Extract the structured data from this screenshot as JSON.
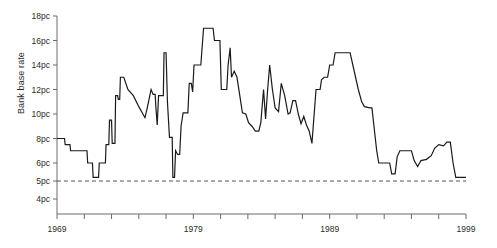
{
  "chart_data": {
    "type": "line",
    "title": "",
    "xlabel": "",
    "ylabel": "Bank base rate",
    "xlim": [
      1969,
      1999
    ],
    "ylim": [
      4,
      18
    ],
    "grid": false,
    "legend": null,
    "y_tick_labels": [
      "18pc",
      "16pc",
      "14pc",
      "12pc",
      "10pc",
      "8pc",
      "6pc",
      "5pc",
      "4pc"
    ],
    "y_tick_values": [
      18,
      16,
      14,
      12,
      10,
      8,
      6,
      5,
      4
    ],
    "x_tick_values": [
      1969,
      1971,
      1973,
      1975,
      1977,
      1979,
      1981,
      1983,
      1985,
      1987,
      1989,
      1991,
      1993,
      1995,
      1997,
      1999
    ],
    "x_tick_labels_shown": [
      "1969",
      "1979",
      "1989",
      "1999"
    ],
    "x_labelled_ticks": [
      1969,
      1979,
      1989,
      1999
    ],
    "reference_line": {
      "value": 5,
      "label": "5pc",
      "style": "dashed",
      "color": "#555555"
    },
    "line_color": "#1a1a1a",
    "axis_color": "#6b6b6b",
    "series": [
      {
        "name": "Bank base rate",
        "points": [
          [
            1969.0,
            8.0
          ],
          [
            1969.55,
            8.0
          ],
          [
            1969.6,
            7.5
          ],
          [
            1969.95,
            7.5
          ],
          [
            1970.0,
            7.0
          ],
          [
            1970.75,
            7.0
          ],
          [
            1970.8,
            7.0
          ],
          [
            1971.2,
            7.0
          ],
          [
            1971.25,
            6.0
          ],
          [
            1971.6,
            6.0
          ],
          [
            1971.65,
            5.2
          ],
          [
            1972.05,
            5.2
          ],
          [
            1972.1,
            6.0
          ],
          [
            1972.55,
            6.0
          ],
          [
            1972.6,
            7.5
          ],
          [
            1972.8,
            7.5
          ],
          [
            1972.85,
            9.5
          ],
          [
            1973.0,
            9.5
          ],
          [
            1973.05,
            7.6
          ],
          [
            1973.25,
            7.6
          ],
          [
            1973.3,
            11.5
          ],
          [
            1973.45,
            11.5
          ],
          [
            1973.5,
            11.2
          ],
          [
            1973.6,
            11.2
          ],
          [
            1973.65,
            13.0
          ],
          [
            1973.9,
            13.0
          ],
          [
            1974.2,
            12.0
          ],
          [
            1974.6,
            11.5
          ],
          [
            1975.0,
            10.6
          ],
          [
            1975.3,
            10.0
          ],
          [
            1975.45,
            9.7
          ],
          [
            1975.6,
            10.4
          ],
          [
            1975.75,
            11.2
          ],
          [
            1975.9,
            12.0
          ],
          [
            1976.05,
            11.6
          ],
          [
            1976.2,
            11.6
          ],
          [
            1976.25,
            10.6
          ],
          [
            1976.35,
            9.1
          ],
          [
            1976.45,
            11.5
          ],
          [
            1976.8,
            11.5
          ],
          [
            1976.85,
            15.0
          ],
          [
            1977.0,
            15.0
          ],
          [
            1977.1,
            11.0
          ],
          [
            1977.25,
            8.1
          ],
          [
            1977.45,
            8.1
          ],
          [
            1977.5,
            5.2
          ],
          [
            1977.62,
            5.2
          ],
          [
            1977.7,
            7.0
          ],
          [
            1977.85,
            6.7
          ],
          [
            1978.0,
            6.7
          ],
          [
            1978.1,
            9.0
          ],
          [
            1978.25,
            10.1
          ],
          [
            1978.6,
            10.1
          ],
          [
            1978.7,
            12.5
          ],
          [
            1978.85,
            12.5
          ],
          [
            1978.95,
            11.8
          ],
          [
            1979.05,
            14.0
          ],
          [
            1979.45,
            14.0
          ],
          [
            1979.55,
            14.0
          ],
          [
            1979.75,
            17.0
          ],
          [
            1980.45,
            17.0
          ],
          [
            1980.55,
            16.0
          ],
          [
            1980.95,
            16.0
          ],
          [
            1981.05,
            12.0
          ],
          [
            1981.45,
            12.0
          ],
          [
            1981.55,
            14.0
          ],
          [
            1981.7,
            15.4
          ],
          [
            1981.8,
            13.0
          ],
          [
            1982.0,
            13.5
          ],
          [
            1982.2,
            13.0
          ],
          [
            1982.45,
            11.2
          ],
          [
            1982.6,
            10.1
          ],
          [
            1982.85,
            10.0
          ],
          [
            1983.05,
            9.3
          ],
          [
            1983.3,
            9.0
          ],
          [
            1983.55,
            8.6
          ],
          [
            1983.8,
            8.6
          ],
          [
            1983.95,
            9.3
          ],
          [
            1984.15,
            12.0
          ],
          [
            1984.3,
            9.6
          ],
          [
            1984.45,
            12.0
          ],
          [
            1984.6,
            14.0
          ],
          [
            1984.8,
            12.0
          ],
          [
            1985.0,
            10.5
          ],
          [
            1985.25,
            10.2
          ],
          [
            1985.45,
            12.5
          ],
          [
            1985.7,
            11.5
          ],
          [
            1985.95,
            10.0
          ],
          [
            1986.1,
            10.1
          ],
          [
            1986.3,
            11.1
          ],
          [
            1986.5,
            11.1
          ],
          [
            1986.7,
            10.0
          ],
          [
            1986.9,
            9.2
          ],
          [
            1987.1,
            9.8
          ],
          [
            1987.3,
            9.1
          ],
          [
            1987.5,
            8.6
          ],
          [
            1987.7,
            7.6
          ],
          [
            1988.0,
            12.0
          ],
          [
            1988.3,
            12.0
          ],
          [
            1988.4,
            12.8
          ],
          [
            1988.6,
            13.0
          ],
          [
            1988.85,
            13.0
          ],
          [
            1989.0,
            14.0
          ],
          [
            1989.25,
            14.0
          ],
          [
            1989.4,
            15.0
          ],
          [
            1990.5,
            15.0
          ],
          [
            1990.7,
            14.0
          ],
          [
            1991.1,
            12.0
          ],
          [
            1991.35,
            11.0
          ],
          [
            1991.55,
            10.6
          ],
          [
            1991.95,
            10.5
          ],
          [
            1992.1,
            10.5
          ],
          [
            1992.45,
            7.0
          ],
          [
            1992.6,
            6.0
          ],
          [
            1993.4,
            6.0
          ],
          [
            1993.55,
            5.4
          ],
          [
            1993.8,
            5.4
          ],
          [
            1993.95,
            6.5
          ],
          [
            1994.15,
            7.0
          ],
          [
            1995.0,
            7.0
          ],
          [
            1995.2,
            6.2
          ],
          [
            1995.45,
            5.8
          ],
          [
            1995.7,
            6.2
          ],
          [
            1996.1,
            6.3
          ],
          [
            1996.45,
            6.6
          ],
          [
            1996.7,
            7.2
          ],
          [
            1997.0,
            7.5
          ],
          [
            1997.35,
            7.4
          ],
          [
            1997.6,
            7.7
          ],
          [
            1997.85,
            7.7
          ],
          [
            1998.05,
            6.0
          ],
          [
            1998.25,
            5.2
          ],
          [
            1999.0,
            5.2
          ]
        ]
      }
    ]
  }
}
